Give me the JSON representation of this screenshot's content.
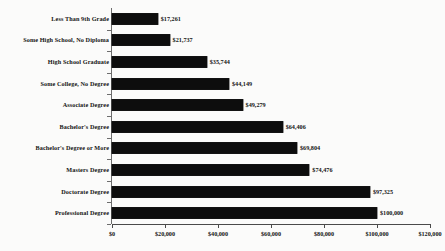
{
  "chart_data": {
    "type": "bar",
    "orientation": "horizontal",
    "title": "",
    "xlabel": "",
    "ylabel": "",
    "xlim": [
      0,
      120000
    ],
    "grid": false,
    "legend": null,
    "tick_labels": [
      "$0",
      "$20,000",
      "$40,000",
      "$60,000",
      "$80,000",
      "$100,000",
      "$120,000"
    ],
    "tick_values": [
      0,
      20000,
      40000,
      60000,
      80000,
      100000,
      120000
    ],
    "categories": [
      "Less Than 9th Grade",
      "Some High School, No Diploma",
      "High School Graduate",
      "Some College, No Degree",
      "Associate Degree",
      "Bachelor's Degree",
      "Bachelor's Degree or More",
      "Masters Degree",
      "Doctorate Degree",
      "Professional Degree"
    ],
    "values": [
      17261,
      21737,
      35744,
      44149,
      49279,
      64406,
      69804,
      74476,
      97325,
      100000
    ],
    "data_labels": [
      "$17,261",
      "$21,737",
      "$35,744",
      "$44,149",
      "$49,279",
      "$64,406",
      "$69,804",
      "$74,476",
      "$97,325",
      "$100,000"
    ],
    "bar_color": "#0d0d0d",
    "background_color": "#fbfbfa"
  }
}
